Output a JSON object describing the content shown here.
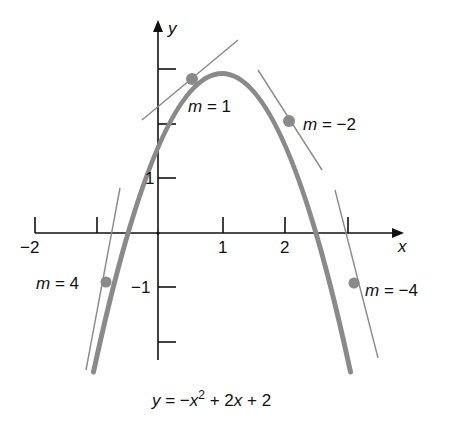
{
  "figure": {
    "equation": "y = −x² + 2x + 2",
    "axis_labels": {
      "x": "x",
      "y": "y"
    },
    "x_ticks": [
      {
        "value": -2,
        "label": "−2"
      },
      {
        "value": -1,
        "label": ""
      },
      {
        "value": 1,
        "label": "1"
      },
      {
        "value": 2,
        "label": "2"
      },
      {
        "value": 3,
        "label": ""
      }
    ],
    "y_ticks": [
      {
        "value": -2,
        "label": ""
      },
      {
        "value": -1,
        "label": "−1"
      },
      {
        "value": 1,
        "label": "1"
      },
      {
        "value": 2,
        "label": ""
      },
      {
        "value": 3,
        "label": ""
      }
    ],
    "tangent_points": [
      {
        "x": -1,
        "y": -1,
        "slope": 4,
        "label": "m = 4"
      },
      {
        "x": 0.5,
        "y": 2.75,
        "slope": 1,
        "label": "m = 1"
      },
      {
        "x": 2,
        "y": 2,
        "slope": -2,
        "label": "m = −2"
      },
      {
        "x": 3,
        "y": -1,
        "slope": -4,
        "label": "m = −4"
      }
    ],
    "colors": {
      "curve": "#8a8a8a",
      "tangent": "#8a8a8a",
      "point": "#8a8a8a",
      "axes": "#111111",
      "text": "#111111"
    }
  },
  "labels": {
    "m4": "m = 4",
    "m1": "m = 1",
    "m_neg2": "m = −2",
    "m_neg4": "m = −4",
    "x_axis": "x",
    "y_axis": "y",
    "tick_neg2": "−2",
    "tick_1": "1",
    "tick_2": "2",
    "ytick_1": "1",
    "ytick_neg1": "−1",
    "equation": "y = −x² + 2x + 2"
  }
}
